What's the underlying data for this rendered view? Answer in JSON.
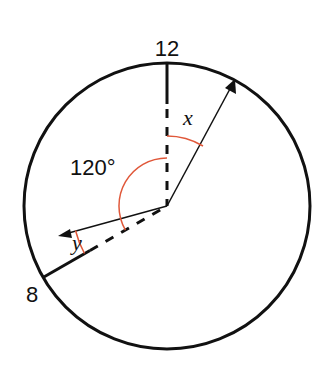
{
  "diagram": {
    "type": "clock-angle-diagram",
    "labels": {
      "twelve": "12",
      "eight": "8",
      "angle_total": "120°",
      "angle_x": "x",
      "angle_y": "y"
    },
    "colors": {
      "stroke": "#111111",
      "arc": "#e0583a",
      "background": "#ffffff"
    },
    "geometry": {
      "center": [
        167,
        206
      ],
      "radius": 143,
      "twelve_direction_deg": 0,
      "eight_direction_deg": 240,
      "angle_between_12_and_8_deg": 120
    }
  }
}
